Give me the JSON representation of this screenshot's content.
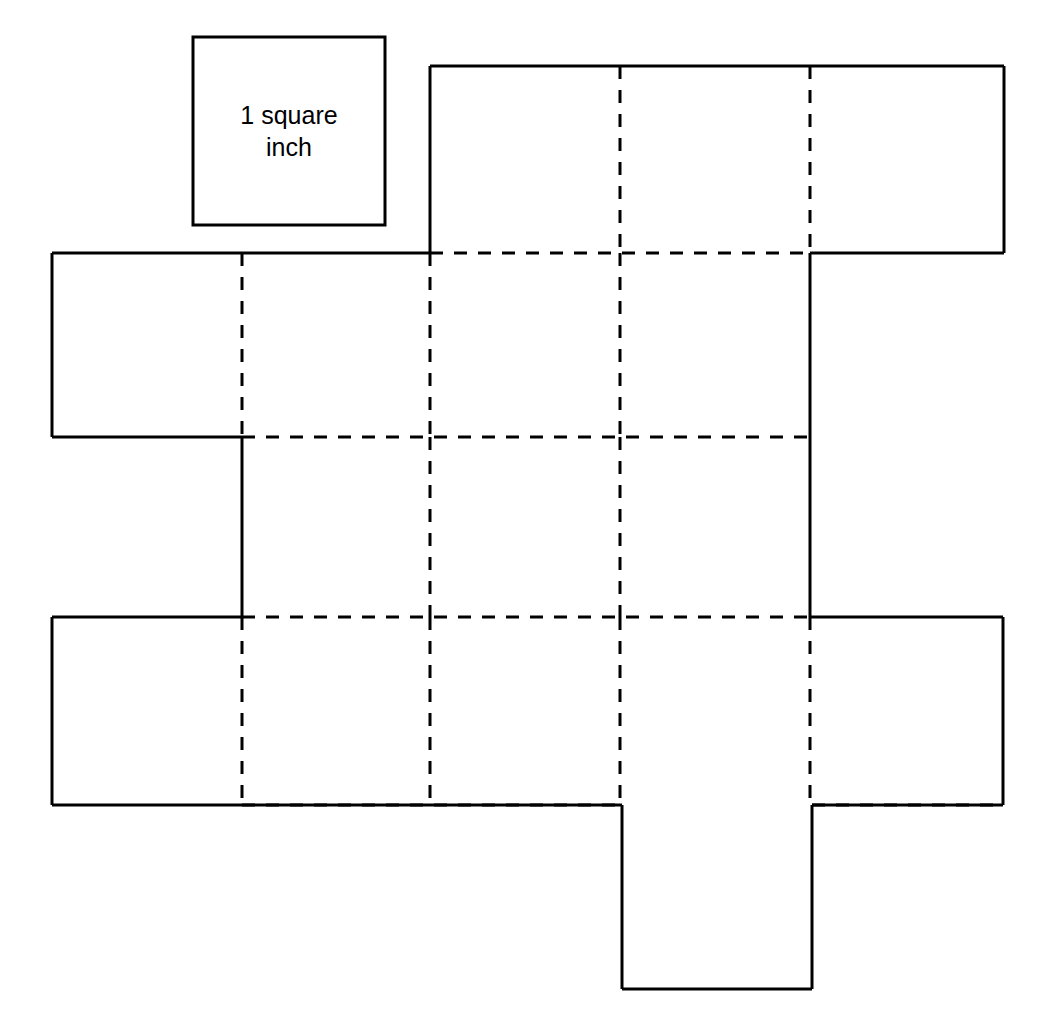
{
  "diagram": {
    "background_color": "#ffffff",
    "stroke_color": "#000000",
    "solid_stroke_width": 3,
    "dashed_stroke_width": 3,
    "dash_pattern": "13 11",
    "grid": {
      "cell_width": 189,
      "cell_height": 188,
      "columns_x": [
        52,
        242,
        430,
        620,
        810,
        1004
      ],
      "rows_y": [
        66,
        253,
        437,
        617,
        805,
        990
      ]
    }
  },
  "legend": {
    "label_line1": "1 square",
    "label_line2": "inch",
    "label_full": "1 square inch",
    "box": {
      "x": 193,
      "y": 37,
      "width": 192,
      "height": 188
    },
    "font_size": 25
  },
  "net": {
    "description": "Unfolded cube net made of unit squares; solid lines are cut edges, dashed lines are fold edges.",
    "faces": [
      {
        "name": "top-row-square-1",
        "col": 2,
        "row": 1,
        "x": 430,
        "y": 66,
        "w": 190,
        "h": 187
      },
      {
        "name": "top-row-square-2",
        "col": 3,
        "row": 1,
        "x": 620,
        "y": 66,
        "w": 190,
        "h": 187
      },
      {
        "name": "top-row-square-3",
        "col": 4,
        "row": 1,
        "x": 810,
        "y": 66,
        "w": 194,
        "h": 187
      },
      {
        "name": "second-row-square-1",
        "col": 0,
        "row": 2,
        "x": 52,
        "y": 253,
        "w": 190,
        "h": 184
      },
      {
        "name": "second-row-square-2",
        "col": 1,
        "row": 2,
        "x": 242,
        "y": 253,
        "w": 188,
        "h": 184
      },
      {
        "name": "second-row-square-3",
        "col": 2,
        "row": 2,
        "x": 430,
        "y": 253,
        "w": 190,
        "h": 184
      },
      {
        "name": "second-row-square-4",
        "col": 3,
        "row": 2,
        "x": 620,
        "y": 253,
        "w": 190,
        "h": 184
      },
      {
        "name": "third-row-square-1",
        "col": 1,
        "row": 3,
        "x": 242,
        "y": 437,
        "w": 188,
        "h": 180
      },
      {
        "name": "third-row-square-2",
        "col": 2,
        "row": 3,
        "x": 430,
        "y": 437,
        "w": 190,
        "h": 180
      },
      {
        "name": "third-row-square-3",
        "col": 3,
        "row": 3,
        "x": 620,
        "y": 437,
        "w": 190,
        "h": 180
      },
      {
        "name": "fourth-row-square-1",
        "col": 0,
        "row": 4,
        "x": 52,
        "y": 617,
        "w": 190,
        "h": 188
      },
      {
        "name": "fourth-row-square-2",
        "col": 1,
        "row": 4,
        "x": 242,
        "y": 617,
        "w": 188,
        "h": 188
      },
      {
        "name": "fourth-row-square-3",
        "col": 2,
        "row": 4,
        "x": 430,
        "y": 617,
        "w": 190,
        "h": 188
      },
      {
        "name": "fourth-row-square-4",
        "col": 3,
        "row": 4,
        "x": 620,
        "y": 617,
        "w": 190,
        "h": 188
      },
      {
        "name": "fourth-row-square-5",
        "col": 4,
        "row": 4,
        "x": 810,
        "y": 617,
        "w": 193,
        "h": 188
      },
      {
        "name": "bottom-tab-square",
        "col": 3,
        "row": 5,
        "x": 622,
        "y": 805,
        "w": 190,
        "h": 184
      }
    ],
    "solid_edges": [
      {
        "name": "top-row-top-edge",
        "x1": 430,
        "y1": 66,
        "x2": 1004,
        "y2": 66
      },
      {
        "name": "top-row-left-edge",
        "x1": 430,
        "y1": 66,
        "x2": 430,
        "y2": 253
      },
      {
        "name": "top-row-right-edge",
        "x1": 1004,
        "y1": 66,
        "x2": 1004,
        "y2": 253
      },
      {
        "name": "top-row-right-bottom-edge",
        "x1": 810,
        "y1": 253,
        "x2": 1004,
        "y2": 253
      },
      {
        "name": "second-row-top-left-edge",
        "x1": 52,
        "y1": 253,
        "x2": 430,
        "y2": 253
      },
      {
        "name": "second-row-left-edge",
        "x1": 52,
        "y1": 253,
        "x2": 52,
        "y2": 437
      },
      {
        "name": "second-row-bottom-left-edge",
        "x1": 52,
        "y1": 437,
        "x2": 242,
        "y2": 437
      },
      {
        "name": "third-row-left-edge",
        "x1": 242,
        "y1": 437,
        "x2": 242,
        "y2": 617
      },
      {
        "name": "middle-right-edge",
        "x1": 810,
        "y1": 253,
        "x2": 810,
        "y2": 617
      },
      {
        "name": "fourth-row-top-left-edge",
        "x1": 52,
        "y1": 617,
        "x2": 242,
        "y2": 617
      },
      {
        "name": "fourth-row-left-edge",
        "x1": 52,
        "y1": 617,
        "x2": 52,
        "y2": 805
      },
      {
        "name": "fourth-row-bottom-left-edge",
        "x1": 52,
        "y1": 805,
        "x2": 622,
        "y2": 805
      },
      {
        "name": "fourth-row-top-right-edge",
        "x1": 810,
        "y1": 617,
        "x2": 1003,
        "y2": 617
      },
      {
        "name": "fourth-row-right-edge",
        "x1": 1003,
        "y1": 617,
        "x2": 1003,
        "y2": 805
      },
      {
        "name": "fourth-row-bottom-right-edge",
        "x1": 812,
        "y1": 805,
        "x2": 1003,
        "y2": 805
      },
      {
        "name": "bottom-tab-left-edge",
        "x1": 622,
        "y1": 805,
        "x2": 622,
        "y2": 989
      },
      {
        "name": "bottom-tab-right-edge",
        "x1": 812,
        "y1": 805,
        "x2": 812,
        "y2": 989
      },
      {
        "name": "bottom-tab-bottom-edge",
        "x1": 622,
        "y1": 989,
        "x2": 812,
        "y2": 989
      }
    ],
    "dashed_edges": [
      {
        "name": "fold-vertical-col2-top",
        "x1": 620,
        "y1": 66,
        "x2": 620,
        "y2": 253
      },
      {
        "name": "fold-vertical-col3-top",
        "x1": 810,
        "y1": 66,
        "x2": 810,
        "y2": 253
      },
      {
        "name": "fold-horizontal-row1-middle",
        "x1": 430,
        "y1": 253,
        "x2": 810,
        "y2": 253
      },
      {
        "name": "fold-vertical-col1-row2",
        "x1": 242,
        "y1": 253,
        "x2": 242,
        "y2": 437
      },
      {
        "name": "fold-vertical-col2-row2",
        "x1": 430,
        "y1": 253,
        "x2": 430,
        "y2": 437
      },
      {
        "name": "fold-vertical-col3-row2",
        "x1": 620,
        "y1": 253,
        "x2": 620,
        "y2": 437
      },
      {
        "name": "fold-horizontal-row2-bottom",
        "x1": 242,
        "y1": 437,
        "x2": 810,
        "y2": 437
      },
      {
        "name": "fold-vertical-col2-row3",
        "x1": 430,
        "y1": 437,
        "x2": 430,
        "y2": 617
      },
      {
        "name": "fold-vertical-col3-row3",
        "x1": 620,
        "y1": 437,
        "x2": 620,
        "y2": 617
      },
      {
        "name": "fold-horizontal-row3-bottom",
        "x1": 242,
        "y1": 617,
        "x2": 810,
        "y2": 617
      },
      {
        "name": "fold-vertical-col1-row4",
        "x1": 242,
        "y1": 617,
        "x2": 242,
        "y2": 805
      },
      {
        "name": "fold-vertical-col2-row4",
        "x1": 430,
        "y1": 617,
        "x2": 430,
        "y2": 805
      },
      {
        "name": "fold-vertical-col3-row4",
        "x1": 620,
        "y1": 617,
        "x2": 620,
        "y2": 805
      },
      {
        "name": "fold-vertical-col4-row4",
        "x1": 810,
        "y1": 617,
        "x2": 810,
        "y2": 805
      },
      {
        "name": "fold-horizontal-row4-bottom-left",
        "x1": 242,
        "y1": 805,
        "x2": 622,
        "y2": 805
      },
      {
        "name": "fold-horizontal-row4-bottom-right",
        "x1": 812,
        "y1": 805,
        "x2": 1003,
        "y2": 805
      }
    ]
  }
}
